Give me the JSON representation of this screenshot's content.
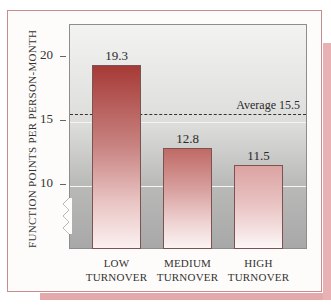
{
  "chart_data": {
    "type": "bar",
    "title": "",
    "xlabel": "",
    "ylabel": "FUNCTION POINTS PER PERSON-MONTH",
    "categories": [
      "LOW TURNOVER",
      "MEDIUM TURNOVER",
      "HIGH TURNOVER"
    ],
    "category_lines": [
      [
        "LOW",
        "TURNOVER"
      ],
      [
        "MEDIUM",
        "TURNOVER"
      ],
      [
        "HIGH",
        "TURNOVER"
      ]
    ],
    "values": [
      19.3,
      12.8,
      11.5
    ],
    "value_labels": [
      "19.3",
      "12.8",
      "11.5"
    ],
    "yticks": [
      10,
      15,
      20
    ],
    "ytick_labels": [
      "10",
      "15",
      "20"
    ],
    "ylim": [
      7,
      21.3
    ],
    "axis_break": true,
    "reference_line": {
      "label": "Average 15.5",
      "value": 15.5,
      "style": "dashed"
    },
    "grid": true,
    "legend": null,
    "colors": {
      "bar_top": "#a63a36",
      "bar_bottom": "#fbf0f0",
      "card_border": "#c98c8e",
      "shadow": "#e3a9ab"
    }
  }
}
